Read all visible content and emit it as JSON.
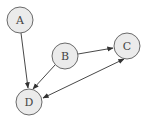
{
  "diagram": {
    "type": "directed-graph",
    "nodes": [
      {
        "id": "A",
        "label": "A",
        "cx": 20,
        "cy": 20,
        "r": 13
      },
      {
        "id": "B",
        "label": "B",
        "cx": 65,
        "cy": 56,
        "r": 13
      },
      {
        "id": "C",
        "label": "C",
        "cx": 127,
        "cy": 46,
        "r": 13
      },
      {
        "id": "D",
        "label": "D",
        "cx": 29,
        "cy": 102,
        "r": 13
      }
    ],
    "edges": [
      {
        "from": "A",
        "to": "D",
        "direction": "forward"
      },
      {
        "from": "B",
        "to": "D",
        "direction": "forward"
      },
      {
        "from": "B",
        "to": "C",
        "direction": "forward"
      },
      {
        "from": "C",
        "to": "D",
        "direction": "both"
      }
    ],
    "colors": {
      "node_fill": "#ebebeb",
      "node_stroke": "#6a6a6a",
      "edge": "#333333",
      "background": "#ffffff"
    }
  }
}
